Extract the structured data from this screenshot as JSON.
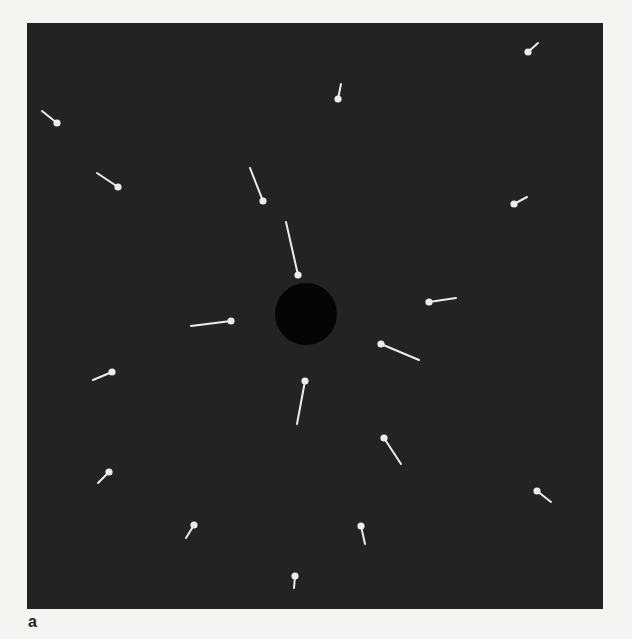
{
  "figure": {
    "panel_label": "a",
    "panel": {
      "x": 27,
      "y": 23,
      "width": 576,
      "height": 586,
      "background": "#232323"
    },
    "page_background": "#f4f4f2",
    "marker_color": "#ececec",
    "central_disc": {
      "cx": 306,
      "cy": 314,
      "r": 31,
      "color": "#050505"
    },
    "markers": [
      {
        "dot": [
          57,
          123
        ],
        "tail": [
          42,
          111
        ]
      },
      {
        "dot": [
          118,
          187
        ],
        "tail": [
          97,
          173
        ]
      },
      {
        "dot": [
          263,
          201
        ],
        "tail": [
          250,
          168
        ]
      },
      {
        "dot": [
          298,
          275
        ],
        "tail": [
          286,
          222
        ]
      },
      {
        "dot": [
          338,
          99
        ],
        "tail": [
          341,
          84
        ]
      },
      {
        "dot": [
          528,
          52
        ],
        "tail": [
          538,
          43
        ]
      },
      {
        "dot": [
          514,
          204
        ],
        "tail": [
          527,
          197
        ]
      },
      {
        "dot": [
          429,
          302
        ],
        "tail": [
          456,
          298
        ]
      },
      {
        "dot": [
          231,
          321
        ],
        "tail": [
          191,
          326
        ]
      },
      {
        "dot": [
          381,
          344
        ],
        "tail": [
          419,
          360
        ]
      },
      {
        "dot": [
          112,
          372
        ],
        "tail": [
          93,
          380
        ]
      },
      {
        "dot": [
          305,
          381
        ],
        "tail": [
          297,
          424
        ]
      },
      {
        "dot": [
          384,
          438
        ],
        "tail": [
          401,
          464
        ]
      },
      {
        "dot": [
          109,
          472
        ],
        "tail": [
          98,
          483
        ]
      },
      {
        "dot": [
          537,
          491
        ],
        "tail": [
          551,
          502
        ]
      },
      {
        "dot": [
          194,
          525
        ],
        "tail": [
          186,
          538
        ]
      },
      {
        "dot": [
          361,
          526
        ],
        "tail": [
          365,
          544
        ]
      },
      {
        "dot": [
          295,
          576
        ],
        "tail": [
          294,
          588
        ]
      }
    ]
  }
}
